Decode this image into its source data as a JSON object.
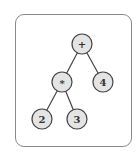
{
  "diagram": {
    "type": "expression-tree",
    "node_fill": "#e4e4e4",
    "node_stroke": "#444444",
    "edge_color": "#444444",
    "nodes": [
      {
        "id": "root",
        "label": "+",
        "x": 82,
        "y": 44
      },
      {
        "id": "mul",
        "label": "*",
        "x": 62,
        "y": 82
      },
      {
        "id": "four",
        "label": "4",
        "x": 103,
        "y": 82
      },
      {
        "id": "two",
        "label": "2",
        "x": 42,
        "y": 119
      },
      {
        "id": "three",
        "label": "3",
        "x": 77,
        "y": 119
      }
    ],
    "edges": [
      [
        "root",
        "mul"
      ],
      [
        "root",
        "four"
      ],
      [
        "mul",
        "two"
      ],
      [
        "mul",
        "three"
      ]
    ]
  }
}
